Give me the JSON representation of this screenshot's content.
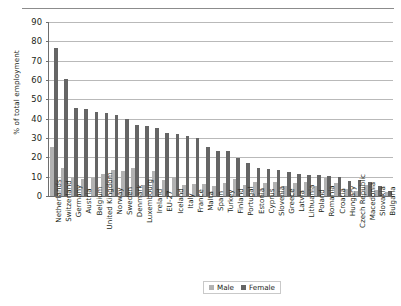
{
  "chart_data": {
    "type": "bar",
    "title": "",
    "xlabel": "",
    "ylabel": "% of total employment",
    "ylim": [
      0,
      90
    ],
    "ytick_step": 10,
    "yticks": [
      0,
      10,
      20,
      30,
      40,
      50,
      60,
      70,
      80,
      90
    ],
    "grid": true,
    "legend_position": "bottom",
    "categories": [
      "Netherlands",
      "Switzerland",
      "Germany",
      "Austria",
      "Belgium",
      "United Kingdom",
      "Norway",
      "Sweden",
      "Denmark",
      "Luxembourg",
      "Ireland",
      "EU-27",
      "Iceland",
      "Italy",
      "France",
      "Malta",
      "Spain",
      "Turkey",
      "Finland",
      "Portugal",
      "Estonia",
      "Cyprus",
      "Slovenia",
      "Greece",
      "Latvia",
      "Lithuania",
      "Poland",
      "Romania",
      "Croatia",
      "Hungary",
      "Czech Republic",
      "Macedonia",
      "Slovakia",
      "Bulgaria"
    ],
    "series": [
      {
        "name": "Male",
        "color": "#b2b2b2",
        "values": [
          25.5,
          14.5,
          9.5,
          9.0,
          9.5,
          11.5,
          13.5,
          13.0,
          14.5,
          5.5,
          13.0,
          8.5,
          10.0,
          5.5,
          6.0,
          6.0,
          5.0,
          6.5,
          9.0,
          5.5,
          7.0,
          6.5,
          7.0,
          5.0,
          6.5,
          7.5,
          5.0,
          9.5,
          6.5,
          3.5,
          2.5,
          5.5,
          3.0,
          2.0
        ]
      },
      {
        "name": "Female",
        "color": "#656565",
        "values": [
          76.5,
          60.5,
          45.5,
          44.8,
          43.3,
          43.0,
          42.0,
          39.8,
          36.5,
          36.4,
          35.3,
          32.5,
          32.2,
          31.3,
          30.0,
          25.5,
          23.5,
          23.5,
          19.6,
          17.0,
          14.5,
          14.0,
          13.5,
          12.5,
          11.5,
          11.0,
          11.0,
          10.5,
          10.0,
          8.0,
          8.5,
          7.5,
          5.0,
          2.5
        ]
      }
    ]
  },
  "legend": {
    "male_label": "Male",
    "female_label": "Female"
  },
  "axis": {
    "y_title": "% of total employment"
  }
}
